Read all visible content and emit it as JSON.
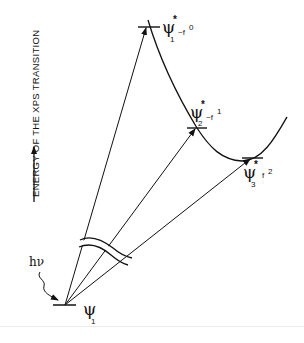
{
  "axis": {
    "label": "ENERGY OF THE XPS TRANSITION",
    "direction": "up"
  },
  "initial_state": {
    "psi": "ψ",
    "subscript": "1"
  },
  "photon": {
    "h": "h",
    "nu": "ν"
  },
  "final_states": [
    {
      "psi": "ψ",
      "star": "*",
      "subscript": "1",
      "occupation": "~f",
      "power": "0"
    },
    {
      "psi": "ψ",
      "star": "*",
      "subscript": "2",
      "occupation": "~f",
      "power": "1"
    },
    {
      "psi": "ψ",
      "star": "*",
      "subscript": "3",
      "occupation": "f",
      "power": "2"
    }
  ],
  "colors": {
    "ink": "#111111",
    "background": "#ffffff"
  }
}
